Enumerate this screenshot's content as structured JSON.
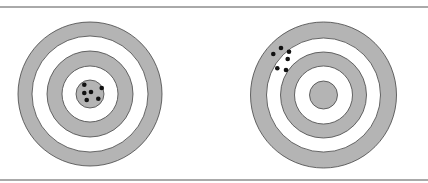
{
  "figure": {
    "frame": {
      "top_line_y": 7,
      "bottom_line_y": 180,
      "line_color": "#555555"
    },
    "colors": {
      "ring_fill": "#b4b4b4",
      "ring_stroke": "#444444",
      "dot": "#111111",
      "background": "#ffffff"
    },
    "targets": [
      {
        "name": "left-target",
        "cx": 90,
        "cy": 94,
        "rings": [
          72,
          58,
          43,
          28,
          14
        ],
        "dots": [
          [
            84.3,
            84.7
          ],
          [
            91,
            92
          ],
          [
            101.7,
            88
          ],
          [
            84.3,
            93
          ],
          [
            86.7,
            100
          ],
          [
            98.3,
            98.7
          ]
        ]
      },
      {
        "name": "right-target",
        "cx": 323.5,
        "cy": 95,
        "rings": [
          73,
          57,
          43,
          29,
          14
        ],
        "dots": [
          [
            281,
            48
          ],
          [
            273.3,
            54
          ],
          [
            289,
            51.7
          ],
          [
            287.7,
            59
          ],
          [
            277.3,
            68.3
          ],
          [
            286,
            70
          ]
        ]
      }
    ]
  }
}
